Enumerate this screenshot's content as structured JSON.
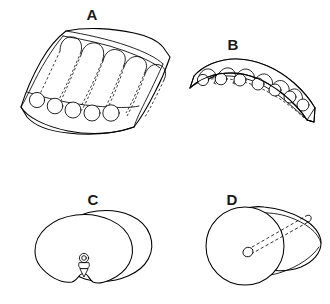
{
  "figure": {
    "background_color": "#ffffff",
    "line_color": "#000000",
    "label_color": "#1a1a1a",
    "width": 330,
    "height": 304
  },
  "panels": [
    {
      "id": "A",
      "label": "A",
      "label_x": 92,
      "label_y": 16,
      "description": "Curved rectangular slab in oblique view containing a serpentine tube routed back and forth; five tube cross-section circles along the lower front edge",
      "tube_end_count": 5,
      "serpentine_bend_count": 5
    },
    {
      "id": "B",
      "label": "B",
      "label_x": 233,
      "label_y": 46,
      "description": "Arched slab segment in oblique view with a serpentine tube; seven tube cross-section circles along the front face",
      "tube_end_count": 7,
      "serpentine_bend_count": 6
    },
    {
      "id": "C",
      "label": "C",
      "label_x": 93,
      "label_y": 201,
      "description": "Kidney or bean shaped body drawn with two overlapping contours and a small circular port with funnel nozzle at lower centre",
      "contour_count": 2,
      "port_count": 1
    },
    {
      "id": "D",
      "label": "D",
      "label_x": 232,
      "label_y": 201,
      "description": "Cylinder in oblique view with a circular near end face and a hidden axial bore shown as dashed lines ending at a small circular opening",
      "bore_count": 1
    }
  ],
  "panel_a_tube_ends": [
    {
      "cx": 37,
      "cy": 100,
      "r": 7.6
    },
    {
      "cx": 55,
      "cy": 106,
      "r": 7.8
    },
    {
      "cx": 73,
      "cy": 110,
      "r": 8.0
    },
    {
      "cx": 92,
      "cy": 113,
      "r": 8.0
    },
    {
      "cx": 111,
      "cy": 113,
      "r": 8.2
    }
  ],
  "panel_b_tube_ends": [
    {
      "cx": 203,
      "cy": 80,
      "r": 5.6
    },
    {
      "cx": 221,
      "cy": 79,
      "r": 5.8
    },
    {
      "cx": 240,
      "cy": 80,
      "r": 6.0
    },
    {
      "cx": 258,
      "cy": 84,
      "r": 6.0
    },
    {
      "cx": 275,
      "cy": 90,
      "r": 6.0
    },
    {
      "cx": 290,
      "cy": 97,
      "r": 6.0
    },
    {
      "cx": 303,
      "cy": 105,
      "r": 6.0
    }
  ]
}
